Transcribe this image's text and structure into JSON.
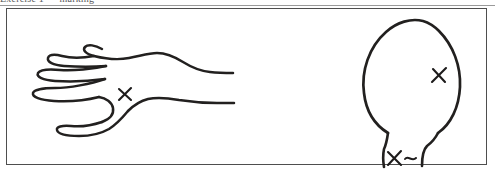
{
  "scan": {
    "background_color": "#ffffff",
    "ink_color": "#22201f",
    "panel_border_color": "#4e4e4e",
    "clipped_caption_text": "Exercise 1 — marking",
    "caption_color": "#5a5a5a"
  },
  "figure": {
    "title": "",
    "panel_label": "",
    "drawings": [
      {
        "name": "hand-drawing",
        "description": "Hand-drawn line outline of a left hand with four fingers pointing left, thumb below, and wrist/forearm extending to the right",
        "marks": [
          {
            "name": "hand-x-mark",
            "glyph": "X",
            "location_label": "wrist / base of thumb",
            "x": 124,
            "y": 91
          }
        ]
      },
      {
        "name": "head-drawing",
        "description": "Hand-drawn oval outline of the back of a head with a neck below drawn as two short vertical strokes",
        "marks": [
          {
            "name": "head-x-mark",
            "glyph": "X",
            "location_label": "right side of head",
            "x": 434,
            "y": 72
          },
          {
            "name": "neck-x-mark",
            "glyph": "X",
            "location_label": "neck",
            "x": 388,
            "y": 152
          },
          {
            "name": "neck-tilde-mark",
            "glyph": "~",
            "location_label": "neck, right of X",
            "x": 404,
            "y": 150
          }
        ]
      }
    ]
  }
}
